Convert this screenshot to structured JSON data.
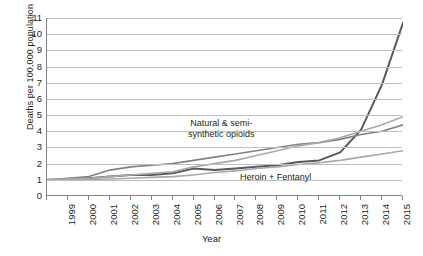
{
  "chart_data": {
    "type": "line",
    "title": "",
    "subtitle": "",
    "xlabel": "Year",
    "ylabel": "Deaths per 100,000 population",
    "xlim": [
      1999,
      2016
    ],
    "ylim": [
      0,
      11
    ],
    "ytick_labels": [
      "11",
      "10",
      "9",
      "8",
      "7",
      "6",
      "5",
      "4",
      "3",
      "2",
      "1",
      "0"
    ],
    "ytick_values": [
      11,
      10,
      9,
      8,
      7,
      6,
      5,
      4,
      3,
      2,
      1,
      0
    ],
    "grid": "horizontal",
    "legend": "none (inline annotations)",
    "x": [
      1999,
      2000,
      2001,
      2002,
      2003,
      2004,
      2005,
      2006,
      2007,
      2008,
      2009,
      2010,
      2011,
      2012,
      2013,
      2014,
      2015,
      2016
    ],
    "categories": [
      "1999",
      "2000",
      "2001",
      "2002",
      "2003",
      "2004",
      "2005",
      "2006",
      "2007",
      "2008",
      "2009",
      "2010",
      "2011",
      "2012",
      "2013",
      "2014",
      "2015",
      "2016"
    ],
    "series": [
      {
        "name": "Heroin + Fentanyl",
        "color": "#58595b",
        "annotation": "Heroin + Fentanyl",
        "values": [
          1.0,
          1.0,
          1.1,
          1.2,
          1.3,
          1.3,
          1.4,
          1.7,
          1.6,
          1.7,
          1.8,
          1.9,
          2.1,
          2.2,
          2.7,
          4.1,
          6.9,
          10.7
        ]
      },
      {
        "name": "Natural & semi-synthetic opioids",
        "color": "#808285",
        "annotation": "Natural & semi-\nsynthetic opioids",
        "values": [
          1.0,
          1.1,
          1.2,
          1.6,
          1.8,
          1.9,
          2.0,
          2.2,
          2.4,
          2.6,
          2.8,
          3.0,
          3.2,
          3.3,
          3.5,
          3.8,
          4.0,
          4.4
        ]
      },
      {
        "name": "series-3",
        "color": "#a7a9ac",
        "annotation": "",
        "values": [
          1.0,
          1.05,
          1.1,
          1.2,
          1.3,
          1.4,
          1.5,
          1.8,
          2.0,
          2.2,
          2.5,
          2.8,
          3.1,
          3.3,
          3.6,
          4.0,
          4.4,
          4.9
        ]
      },
      {
        "name": "series-4",
        "color": "#a7a9ac",
        "annotation": "",
        "values": [
          1.0,
          1.0,
          1.0,
          1.05,
          1.1,
          1.15,
          1.2,
          1.3,
          1.45,
          1.55,
          1.7,
          1.8,
          1.95,
          2.05,
          2.2,
          2.4,
          2.6,
          2.8
        ]
      }
    ],
    "annotations": [
      {
        "text": "Natural & semi-",
        "series": "Natural & semi-synthetic opioids"
      },
      {
        "text": "synthetic opioids",
        "series": "Natural & semi-synthetic opioids"
      },
      {
        "text": "Heroin + Fentanyl",
        "series": "Heroin + Fentanyl"
      }
    ],
    "colors": {
      "grid": "#bcbec0",
      "axis": "#808285",
      "text": "#231f20",
      "background": "#ffffff"
    }
  },
  "annotation_labels": {
    "natural_line1": "Natural & semi-",
    "natural_line2": "synthetic opioids",
    "heroin": "Heroin + Fentanyl"
  }
}
